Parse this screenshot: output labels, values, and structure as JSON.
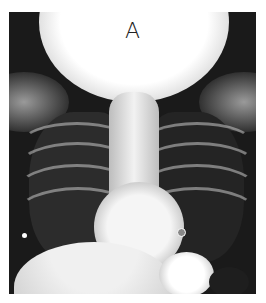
{
  "figure": {
    "panel_label": "A"
  }
}
